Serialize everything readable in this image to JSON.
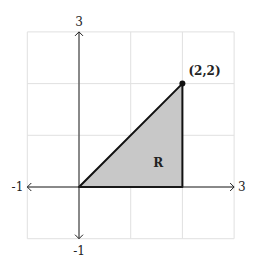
{
  "diagram": {
    "type": "coordinate-plane-region",
    "x_range": [
      -1,
      3
    ],
    "y_range": [
      -1,
      3
    ],
    "grid_step": 1,
    "axis_labels": {
      "x_min": "-1",
      "x_max": "3",
      "y_min": "-1",
      "y_max": "3"
    },
    "region": {
      "label": "R",
      "vertices": [
        [
          0,
          0
        ],
        [
          2,
          2
        ],
        [
          2,
          0
        ]
      ],
      "fill_color": "#c8c8c8",
      "stroke_color": "#111111"
    },
    "point": {
      "coords": [
        2,
        2
      ],
      "label": "(2,2)"
    }
  }
}
